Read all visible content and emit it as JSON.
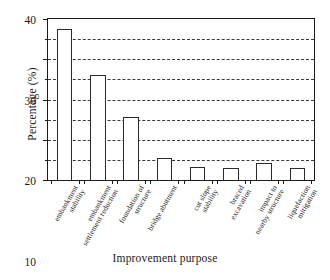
{
  "chart_data": {
    "type": "bar",
    "title": "",
    "xlabel": "Improvement purpose",
    "ylabel": "Percentage (%)",
    "categories": [
      "embankment stability",
      "embankment settlement reduction",
      "foundation of structure",
      "bridge abutment",
      "cut slope stability",
      "braced excavation",
      "impact to nearby structure",
      "liquefaction mitigation"
    ],
    "category_lines": [
      [
        "embankment",
        "stability"
      ],
      [
        "embankment",
        "settlement reduction"
      ],
      [
        "foundation of",
        "structure"
      ],
      [
        "bridge abutment"
      ],
      [
        "cut slope",
        "stability"
      ],
      [
        "braced",
        "excavation"
      ],
      [
        "impact to",
        "nearby structure"
      ],
      [
        "liquefaction",
        "mitigation"
      ]
    ],
    "values": [
      37.5,
      26.0,
      15.7,
      5.4,
      3.3,
      3.0,
      4.3,
      3.0
    ],
    "ylim": [
      0,
      40
    ],
    "ytick_labels": [
      "0",
      "10",
      "20",
      "30",
      "40"
    ],
    "ytick_values": [
      0,
      10,
      20,
      30,
      40
    ],
    "gridline_values": [
      5,
      10,
      15,
      20,
      25,
      30,
      35
    ],
    "minor_tick_values": [
      5,
      15,
      25,
      35
    ],
    "grid": "horizontal-dashed",
    "legend": "none",
    "bar_fill_color": "#ffffff",
    "bar_edge_color": "#2b2b2b",
    "axis_color": "#1a1a1a",
    "grid_color": "#3a3a3a",
    "background_color": "#ffffff"
  }
}
